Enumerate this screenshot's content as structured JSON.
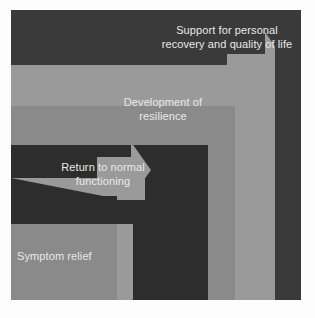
{
  "diagram": {
    "type": "staircase-arrow-diagram",
    "colors": {
      "background_light": "#8a8a8a",
      "background_dark": "#3a3a3a",
      "arrow_light": "#9a9a9a",
      "arrow_dark": "#2f2f2f",
      "text": "#e9e9e9",
      "border": "#ffffff"
    },
    "steps": [
      {
        "order": 1,
        "label": "Symptom relief",
        "arrow_style": "light-elbow-arrow",
        "arrow_direction": "right-then-up"
      },
      {
        "order": 2,
        "label": "Return to normal\nfunctioning",
        "arrow_style": "dark-elbow-arrow",
        "arrow_direction": "right-then-up"
      },
      {
        "order": 3,
        "label": "Development of\nresilience",
        "arrow_style": "light-elbow-arrow",
        "arrow_direction": "right-then-up"
      },
      {
        "order": 4,
        "label": "Support for personal\nrecovery and quality of life",
        "arrow_style": "none",
        "arrow_direction": "none"
      }
    ]
  }
}
